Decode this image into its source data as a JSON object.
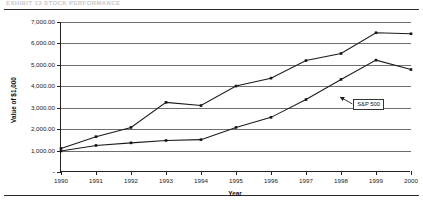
{
  "document": {
    "header_text_faint": "EXHIBIT 13    STOCK PERFORMANCE",
    "rule_top_name": "horizontal-rule",
    "rule_bottom_name": "horizontal-rule"
  },
  "chart_data": {
    "type": "line",
    "title": "",
    "xlabel": "Year",
    "ylabel": "Value of $1,000",
    "x": [
      1990,
      1991,
      1992,
      1993,
      1994,
      1995,
      1996,
      1997,
      1998,
      1999,
      2000
    ],
    "xtick_labels": [
      "1990",
      "1991",
      "1992",
      "1993",
      "1994",
      "1995",
      "1996",
      "1997",
      "1998",
      "1999",
      "2000"
    ],
    "ylim": [
      0,
      7000
    ],
    "ytick_values": [
      0,
      1000,
      2000,
      3000,
      4000,
      5000,
      6000,
      7000
    ],
    "ytick_labels": [
      "-",
      "1,000.00",
      "2,000.00",
      "3,000.00",
      "4,000.00",
      "5,000.00",
      "6,000.00",
      "7,000.00"
    ],
    "grid": true,
    "grid_axis": "y",
    "legend_position": "none",
    "series": [
      {
        "name": "Company",
        "marker": "square",
        "color": "#141414",
        "values": [
          1100,
          1650,
          2080,
          3250,
          3100,
          4010,
          4380,
          5200,
          5530,
          6500,
          6450
        ]
      },
      {
        "name": "S&P 500",
        "marker": "square",
        "color": "#141414",
        "values": [
          980,
          1240,
          1360,
          1470,
          1510,
          2080,
          2550,
          3380,
          4320,
          5220,
          4780
        ]
      }
    ],
    "annotations": [
      {
        "label": "S&P 500",
        "target_x": 1998,
        "target_y": 3500,
        "box_x": 1998.35,
        "box_y": 3180
      }
    ]
  }
}
